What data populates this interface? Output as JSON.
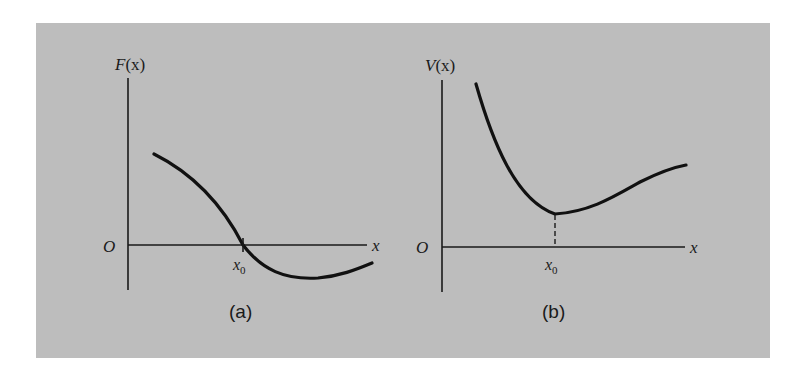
{
  "figure": {
    "background_color": "#bdbdbd",
    "ink_color": "#111111",
    "panels": [
      {
        "id": "a",
        "caption": "(a)",
        "y_axis_label": "F(x)",
        "y_axis_func": "F",
        "y_axis_arg": "(x)",
        "x_axis_label": "x",
        "origin_label": "O",
        "marker_label": "x",
        "marker_subscript": "0",
        "description": "Force F(x) decreasing, crossing zero at x0 (marked with tick), going negative then rising slightly"
      },
      {
        "id": "b",
        "caption": "(b)",
        "y_axis_label": "V(x)",
        "y_axis_func": "V",
        "y_axis_arg": "(x)",
        "x_axis_label": "x",
        "origin_label": "O",
        "marker_label": "x",
        "marker_subscript": "0",
        "description": "Potential V(x) falling steeply to a minimum at x0 (dashed drop line), then rising gently"
      }
    ]
  }
}
